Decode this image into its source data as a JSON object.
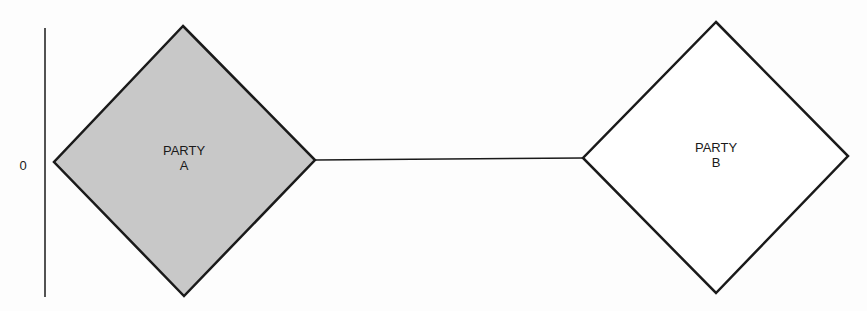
{
  "diagram": {
    "axis": {
      "label": "0"
    },
    "nodes": [
      {
        "id": "party-a",
        "line1": "PARTY",
        "line2": "A",
        "fill": "#c8c8c8",
        "stroke": "#1a1a1a"
      },
      {
        "id": "party-b",
        "line1": "PARTY",
        "line2": "B",
        "fill": "#ffffff",
        "stroke": "#1a1a1a"
      }
    ],
    "edges": [
      {
        "from": "party-a",
        "to": "party-b"
      }
    ]
  }
}
